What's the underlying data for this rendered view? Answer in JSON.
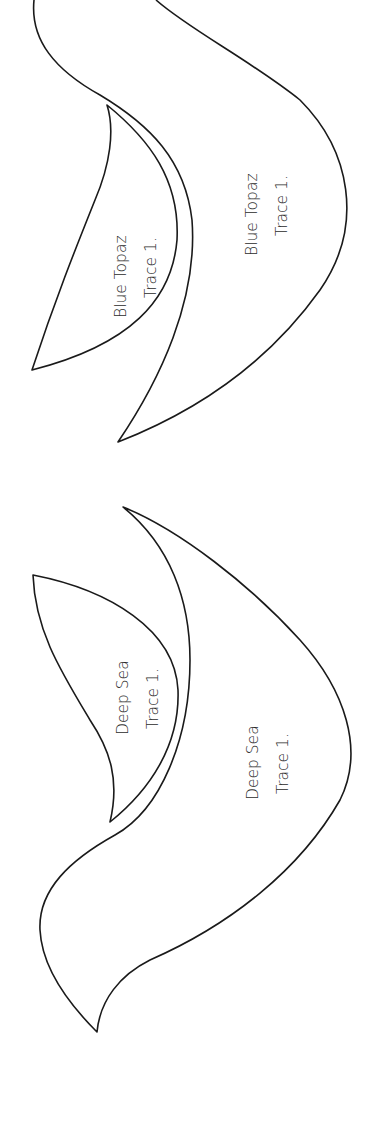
{
  "page": {
    "background": "#ffffff",
    "stroke_color": "#1a1a1a",
    "text_color": "#2b2b2b"
  },
  "templates": {
    "blue_topaz": {
      "name": "Blue Topaz",
      "large_piece": {
        "line1": "Blue Topaz",
        "line2": "Trace 1."
      },
      "small_piece": {
        "line1": "Blue Topaz",
        "line2": "Trace 1."
      }
    },
    "deep_sea": {
      "name": "Deep Sea",
      "large_piece": {
        "line1": "Deep Sea",
        "line2": "Trace 1."
      },
      "small_piece": {
        "line1": "Deep Sea",
        "line2": "Trace 1."
      }
    }
  }
}
